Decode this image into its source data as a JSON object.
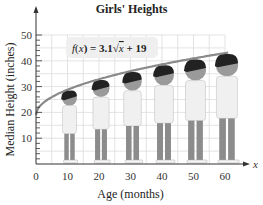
{
  "chart_data": {
    "type": "line",
    "title": "Girls' Heights",
    "xlabel": "Age (months)",
    "ylabel": "Median Height (inches)",
    "x_axis_symbol": "x",
    "equation": "f(x) = 3.1√x + 19",
    "x_ticks": [
      0,
      10,
      20,
      30,
      40,
      50,
      60
    ],
    "y_ticks": [
      10,
      20,
      30,
      40,
      50
    ],
    "xlim": [
      0,
      65
    ],
    "ylim": [
      0,
      52
    ],
    "grid": true,
    "series": [
      {
        "name": "f(x) = 3.1√x + 19",
        "x": [
          0,
          10,
          20,
          30,
          40,
          50,
          60
        ],
        "values": [
          19.0,
          28.8,
          32.9,
          36.0,
          38.6,
          40.9,
          43.0
        ]
      }
    ],
    "annotations": [
      "Illustrated girls standing at ages 10, 20, 30, 40, 50, 60 months, heads touching the curve"
    ]
  },
  "labels": {
    "title": "Girls' Heights",
    "xlabel": "Age (months)",
    "ylabel": "Median Height (inches)",
    "x_symbol": "x",
    "formula_prefix": "f(x) = 3.1",
    "formula_radicand": "x",
    "formula_suffix": " + 19",
    "origin": "0",
    "x_tick_labels": [
      "10",
      "20",
      "30",
      "40",
      "50",
      "60"
    ],
    "y_tick_labels": [
      "10",
      "20",
      "30",
      "40",
      "50"
    ]
  },
  "colors": {
    "curve": "#8a8a8a",
    "grid": "#dcdcdc",
    "axis": "#333333",
    "formula_bg": "#efefef",
    "hair": "#222222",
    "skin": "#9a9a9a",
    "shirt": "#f0f0f0",
    "pants": "#8c8c8c"
  }
}
